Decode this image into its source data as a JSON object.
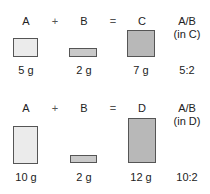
{
  "rows": [
    {
      "labels": {
        "a": "A",
        "plus": "+",
        "b": "B",
        "eq": "=",
        "product": "C",
        "ratio_title": "A/B",
        "ratio_sub": "(in C)"
      },
      "values": {
        "a": "5 g",
        "b": "2 g",
        "product": "7 g",
        "ratio": "5:2"
      }
    },
    {
      "labels": {
        "a": "A",
        "plus": "+",
        "b": "B",
        "eq": "=",
        "product": "D",
        "ratio_title": "A/B",
        "ratio_sub": "(in D)"
      },
      "values": {
        "a": "10 g",
        "b": "2 g",
        "product": "12 g",
        "ratio": "10:2"
      }
    }
  ],
  "colors": {
    "a_fill": "#ebebeb",
    "b_fill": "#c9c9c9",
    "product_fill": "#b8b8b8",
    "border": "#555555"
  }
}
